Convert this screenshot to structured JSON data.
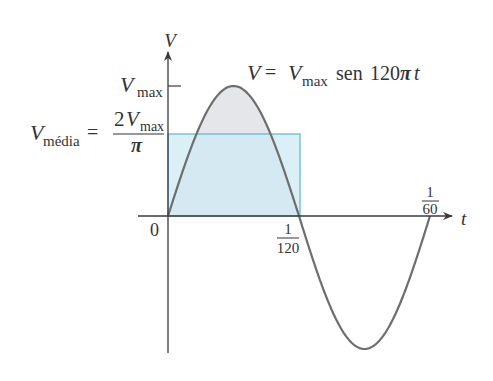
{
  "figure": {
    "type": "sine-wave-average-diagram",
    "colors": {
      "curve": "#6e6e6e",
      "axis": "#3a3a3a",
      "fill_positive_lobe": "#e4e6ea",
      "average_rect_fill": "#cfe9f3",
      "average_rect_stroke": "#5ab4d8",
      "text": "#333333"
    }
  },
  "axes": {
    "y_label": "V",
    "x_label": "t",
    "origin_label": "0"
  },
  "labels": {
    "vmax": {
      "main": "V",
      "sub": "max"
    },
    "vmedia": {
      "lhs_main": "V",
      "lhs_sub": "média",
      "equals": "=",
      "num_coef": "2",
      "num_main": "V",
      "num_sub": "max",
      "den": "π"
    },
    "equation": {
      "lhs": "V",
      "equals": "=",
      "vmax_main": "V",
      "vmax_sub": "max",
      "func": "sen",
      "arg_num": "120",
      "arg_pi": "π",
      "arg_t": "t"
    },
    "tick_half_period": {
      "num": "1",
      "den": "120"
    },
    "tick_period": {
      "num": "1",
      "den": "60"
    }
  },
  "chart_data": {
    "type": "line",
    "xlabel": "t",
    "ylabel": "V",
    "x_ticks": [
      "0",
      "1/120",
      "1/60"
    ],
    "y_ticks": [
      "Vmax",
      "2Vmax/π"
    ],
    "series": [
      {
        "name": "V(t) = Vmax sin(120πt)",
        "x": [
          0,
          0.004167,
          0.008333,
          0.0125,
          0.016667
        ],
        "values": [
          0,
          1,
          0,
          -1,
          0
        ]
      }
    ],
    "average_value": {
      "label": "Vmédia = 2Vmax/π",
      "value_fraction_of_vmax": 0.6366,
      "over_interval": [
        0,
        0.008333
      ]
    },
    "grid": false
  }
}
